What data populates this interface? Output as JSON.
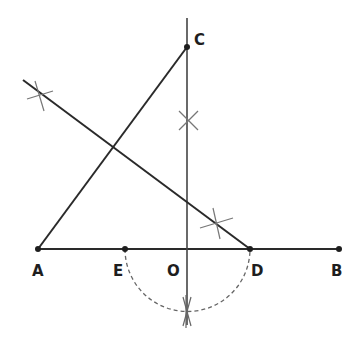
{
  "diagram": {
    "colors": {
      "line": "#2a2a2a",
      "construction": "#777777",
      "label": "#1e1e1e"
    },
    "points": {
      "A": {
        "label": "A",
        "x": 38,
        "y": 249
      },
      "E": {
        "label": "E",
        "x": 125,
        "y": 249
      },
      "O": {
        "label": "O",
        "x": 187,
        "y": 249
      },
      "D": {
        "label": "D",
        "x": 250,
        "y": 249
      },
      "B": {
        "label": "B",
        "x": 339,
        "y": 249
      },
      "C": {
        "label": "C",
        "x": 187,
        "y": 47
      }
    },
    "segments": [
      {
        "name": "AB",
        "from": "A",
        "to": "B",
        "style": "solid"
      },
      {
        "name": "AC",
        "from": "A",
        "to": "C",
        "style": "solid"
      },
      {
        "name": "perpendicular-at-O",
        "x": 187,
        "y1": 18,
        "y2": 325,
        "style": "solid"
      },
      {
        "name": "bisector-line",
        "x1": 23,
        "y1": 80,
        "x2": 250,
        "y2": 249,
        "style": "solid"
      }
    ],
    "arc": {
      "name": "semicircle-ED",
      "center": "O",
      "radius": 63,
      "style": "dashed"
    },
    "construction_marks": [
      "cross-on-bisector-left",
      "cross-on-perpendicular",
      "cross-near-D",
      "cross-below-O"
    ]
  }
}
